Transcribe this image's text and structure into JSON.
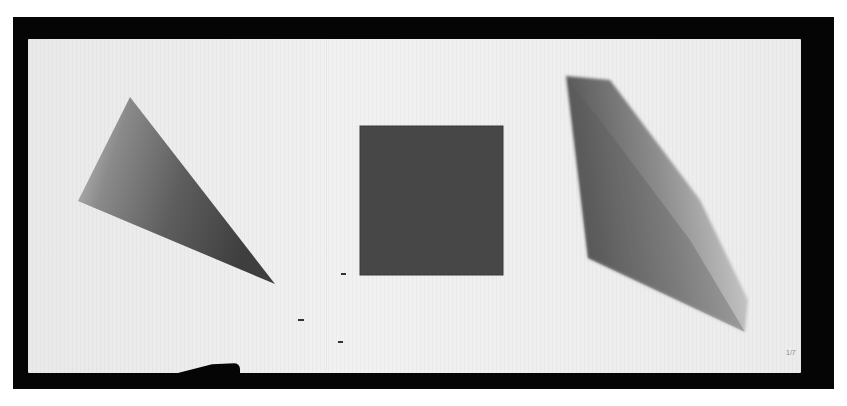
{
  "artwork": {
    "description": "Photograph of an open folded paper sheet on a black background with three painted geometric shapes",
    "shapes": [
      {
        "name": "triangle",
        "fill": "#5f5f5f",
        "points": [
          [
            130,
            97
          ],
          [
            78,
            201
          ],
          [
            275,
            284
          ]
        ]
      },
      {
        "name": "square",
        "fill": "#444444",
        "bounds": {
          "x": 360,
          "y": 126,
          "w": 143,
          "h": 149
        }
      },
      {
        "name": "parallelogram",
        "fill": "#777777",
        "points": [
          [
            566,
            76
          ],
          [
            588,
            258
          ],
          [
            745,
            332
          ],
          [
            705,
            215
          ]
        ]
      }
    ],
    "colors": {
      "background": "#ffffff",
      "frame": "#050505",
      "paper": "#ececec"
    },
    "page_mark": "1/7"
  }
}
